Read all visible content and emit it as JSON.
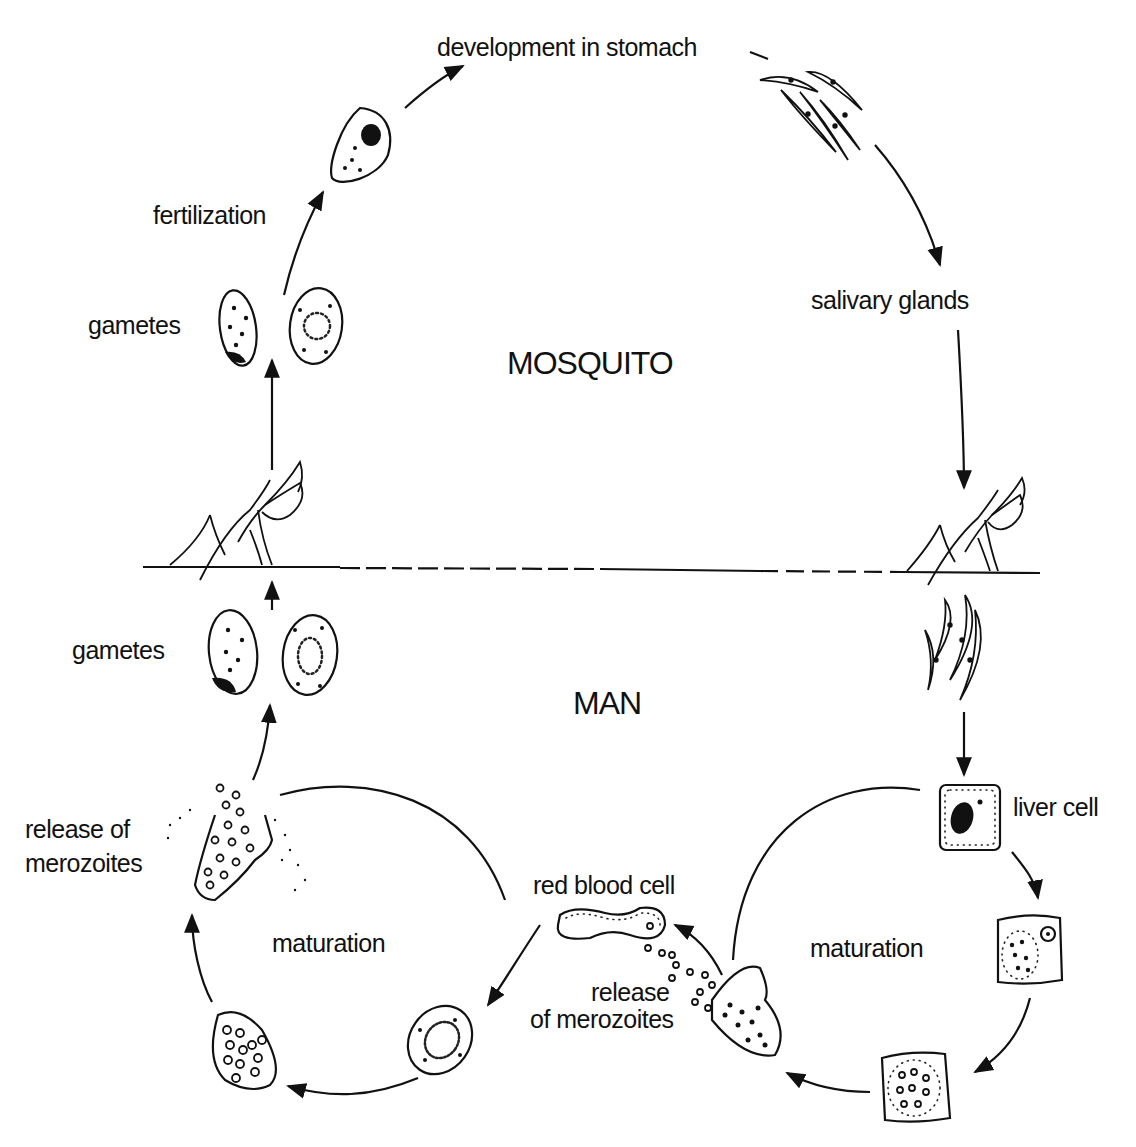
{
  "diagram": {
    "type": "life-cycle",
    "regions": {
      "top": "MOSQUITO",
      "bottom": "MAN"
    },
    "labels": {
      "development": "development in stomach",
      "fertilization": "fertilization",
      "gametes_top": "gametes",
      "salivary": "salivary glands",
      "gametes_bottom": "gametes",
      "release_left_1": "release of",
      "release_left_2": "merozoites",
      "maturation_left": "maturation",
      "red_blood_cell": "red blood cell",
      "release_mid_1": "release",
      "release_mid_2": "of merozoites",
      "maturation_right": "maturation",
      "liver_cell": "liver cell"
    },
    "stages": [
      {
        "id": "gametes-mosquito",
        "label": "gametes"
      },
      {
        "id": "zygote",
        "label": "fertilization"
      },
      {
        "id": "oocyst",
        "label": "development in stomach"
      },
      {
        "id": "sporozoites-salivary",
        "label": "salivary glands"
      },
      {
        "id": "bite-inject",
        "label": ""
      },
      {
        "id": "sporozoites-blood",
        "label": ""
      },
      {
        "id": "liver-cell",
        "label": "liver cell"
      },
      {
        "id": "liver-schizont",
        "label": "maturation"
      },
      {
        "id": "liver-rupture",
        "label": "release of merozoites"
      },
      {
        "id": "red-blood-cell",
        "label": "red blood cell"
      },
      {
        "id": "trophozoite",
        "label": "maturation"
      },
      {
        "id": "rbc-schizont",
        "label": ""
      },
      {
        "id": "rbc-rupture",
        "label": "release of merozoites"
      },
      {
        "id": "gametes-man",
        "label": "gametes"
      },
      {
        "id": "bite-ingest",
        "label": ""
      }
    ],
    "divider": "dashed horizontal line separating mosquito and man"
  }
}
